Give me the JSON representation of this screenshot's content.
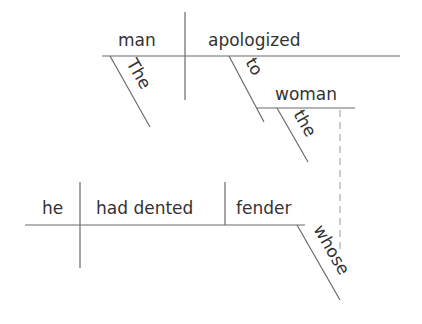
{
  "diagram": {
    "type": "sentence-diagram (Reed-Kellogg)",
    "main_clause": {
      "subject": "man",
      "verb": "apologized",
      "subject_modifier": "The",
      "preposition": "to",
      "prep_object": "woman",
      "prep_object_modifier": "the"
    },
    "relative_clause": {
      "subject": "he",
      "verb": "had dented",
      "object": "fender",
      "object_modifier": "whose"
    },
    "connector": "dashed line linking woman to whose"
  },
  "colors": {
    "line": "#6b6b6b",
    "text": "#333333",
    "dash": "#9a9a9a"
  }
}
